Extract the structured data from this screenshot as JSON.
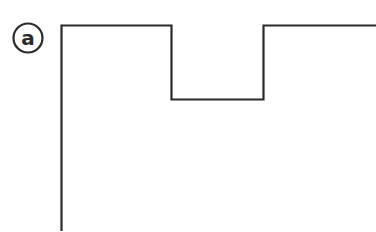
{
  "figure": {
    "label": "a",
    "stroke_color": "#2a2a2a",
    "background": "#ffffff",
    "shape": "rectangle-with-top-notch"
  }
}
